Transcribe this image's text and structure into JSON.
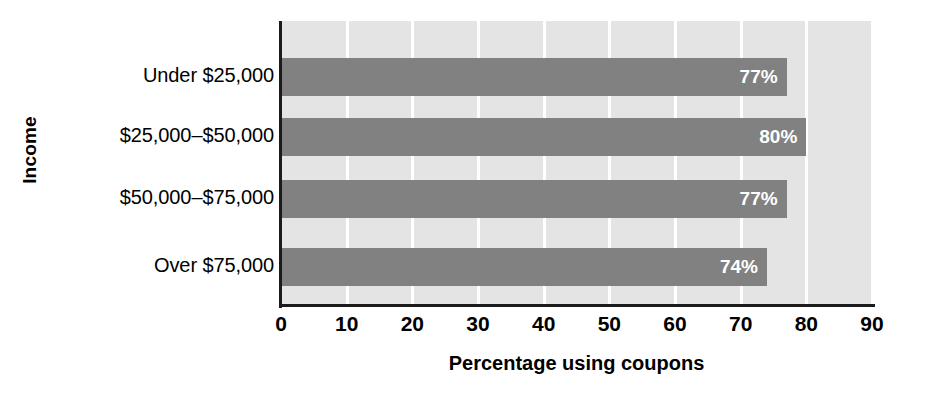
{
  "chart_data": {
    "type": "bar",
    "orientation": "horizontal",
    "title": "",
    "xlabel": "Percentage using coupons",
    "ylabel": "Income",
    "categories": [
      "Under $25,000",
      "$25,000–$50,000",
      "$50,000–$75,000",
      "Over $75,000"
    ],
    "values": [
      77,
      80,
      77,
      74
    ],
    "data_labels": [
      "77%",
      "80%",
      "77%",
      "74%"
    ],
    "xlim": [
      0,
      90
    ],
    "xticks": [
      0,
      10,
      20,
      30,
      40,
      50,
      60,
      70,
      80,
      90
    ],
    "xtick_labels": [
      "0",
      "10",
      "20",
      "30",
      "40",
      "50",
      "60",
      "70",
      "80",
      "90"
    ],
    "grid": "vertical-white-gridlines",
    "legend": "none"
  },
  "style": {
    "plot_background": "#e4e4e4",
    "bar_color": "#818181",
    "gridline_color": "#ffffff",
    "axis_color": "#1b1b1b",
    "data_label_color": "#ffffff",
    "page_background": "#ffffff"
  }
}
